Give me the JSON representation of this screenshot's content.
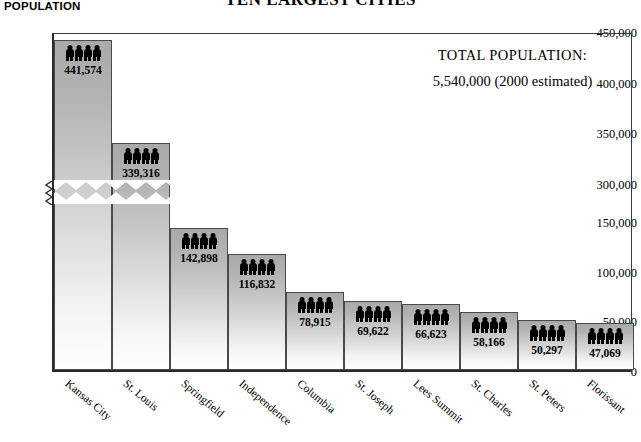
{
  "title": "TEN LARGEST CITIES",
  "y_axis_title": "POPULATION",
  "total": {
    "label": "TOTAL POPULATION:",
    "value": "5,540,000  (2000 estimated)"
  },
  "icon": "person-icon",
  "icons_per_bar": 4,
  "colors": {
    "bar_top": "#a9a9a9",
    "bar_bottom": "#ffffff",
    "bar_border": "#4a4a4a",
    "axis": "#2b2b2b",
    "icon": "#000000"
  },
  "chart_data": {
    "type": "bar",
    "title": "TEN LARGEST CITIES",
    "xlabel": "",
    "ylabel": "POPULATION",
    "categories": [
      "Kansas City",
      "St. Louis",
      "Springfield",
      "Independence",
      "Columbia",
      "St. Joseph",
      "Lees Summit",
      "St. Charles",
      "St. Peters",
      "Florissant"
    ],
    "values": [
      441574,
      339316,
      142898,
      116832,
      78915,
      69622,
      66623,
      58166,
      50297,
      47069
    ],
    "value_labels": [
      "441,574",
      "339,316",
      "142,898",
      "116,832",
      "78,915",
      "69,622",
      "66,623",
      "58,166",
      "50,297",
      "47,069"
    ],
    "ytick_labels": [
      "450,000",
      "400,000",
      "350,000",
      "300,000",
      "150,000",
      "100,000",
      "50,000",
      "0"
    ],
    "ytick_values": [
      450000,
      400000,
      350000,
      300000,
      150000,
      100000,
      50000,
      0
    ],
    "axis_break": {
      "present": true,
      "between": [
        300000,
        150000
      ],
      "style": "zigzag"
    },
    "ylim": [
      0,
      450000
    ],
    "grid": false,
    "legend": "none"
  }
}
